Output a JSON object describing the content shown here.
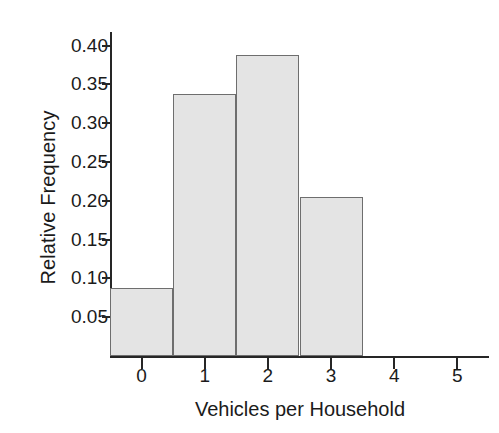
{
  "chart_data": {
    "type": "bar",
    "title": "",
    "subtitle": "",
    "xlabel": "Vehicles per Household",
    "ylabel": "Relative Frequency",
    "categories": [
      "0",
      "1",
      "2",
      "3"
    ],
    "values": [
      0.088,
      0.337,
      0.388,
      0.205
    ],
    "series": [
      {
        "name": "Relative Frequency",
        "values": [
          0.088,
          0.337,
          0.388,
          0.205
        ]
      }
    ],
    "xlim": [
      -0.5,
      5.5
    ],
    "ylim": [
      0.0,
      0.42
    ],
    "xticks": [
      "0",
      "1",
      "2",
      "3",
      "4",
      "5"
    ],
    "xtick_values": [
      0,
      1,
      2,
      3,
      4,
      5
    ],
    "yticks": [
      "0.05",
      "0.10",
      "0.15",
      "0.20",
      "0.25",
      "0.30",
      "0.35",
      "0.40"
    ],
    "ytick_values": [
      0.05,
      0.1,
      0.15,
      0.2,
      0.25,
      0.3,
      0.35,
      0.4
    ],
    "grid": false,
    "legend": null,
    "legend_position": "none",
    "bar_width": 1.0,
    "annotations": []
  },
  "style": {
    "bar_fill": "#e4e4e4",
    "bar_border": "#6e6e6e",
    "axis_color": "#262626",
    "text_color": "#1b1b1b",
    "background": "#ffffff"
  }
}
